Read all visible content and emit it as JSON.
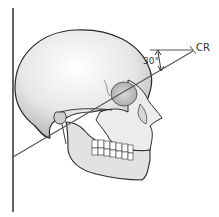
{
  "diagram": {
    "labels": {
      "central_ray": "CR",
      "angle": "30°"
    },
    "elements": [
      "image-receptor-line",
      "skull-lateral-view",
      "central-ray-line",
      "horizontal-reference-line",
      "angle-arc-arrow"
    ],
    "colors": {
      "line": "#555555",
      "skull_outline": "#2a2a2a",
      "skull_fill": "#e8e8e8"
    }
  }
}
